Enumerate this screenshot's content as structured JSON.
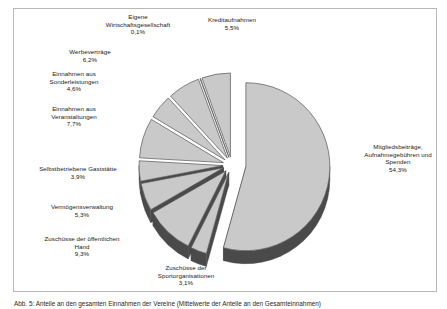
{
  "figure": {
    "frame_color": "#b9b9b9",
    "background": "#ffffff",
    "caption": "Abb. 5: Anteile an den gesamten Einnahmen der Vereine (Mittelwerte der Anteile an den Gesamteinnahmen)"
  },
  "chart_data": {
    "type": "pie",
    "title": "",
    "subtitle": "",
    "xlabel": "",
    "ylabel": "",
    "legend_position": "labels-outside",
    "grid": false,
    "style": "3d-exploded",
    "value_unit": "%",
    "decimal_separator": ",",
    "slice_fill": "#c9c9c9",
    "slice_side": "#4a4a4a",
    "slice_stroke": "#555555",
    "total": 100.0,
    "categories": [
      "Mitgliedsbeiträge, Aufnahmegebühren und Spenden",
      "Zuschüsse der Sportorganisationen",
      "Zuschüsse der öffentlichen Hand",
      "Vermögensverwaltung",
      "Selbstbetriebene Gaststätte",
      "Einnahmen aus Veranstaltungen",
      "Einnahmen aus Sonderleistungen",
      "Werbeverträge",
      "Eigene Wirtschaftsgesellschaft",
      "Kreditaufnahmen"
    ],
    "values": [
      54.3,
      3.1,
      9.3,
      5.3,
      3.9,
      7.7,
      4.6,
      6.2,
      0.1,
      5.5
    ],
    "slices": [
      {
        "label": "Mitgliedsbeiträge,\nAufnahmegebühren und\nSpenden",
        "value": 54.3,
        "value_text": "54,3%",
        "label_x": 352,
        "label_y": 143,
        "label_w": 92
      },
      {
        "label": "Zuschüsse der\nSportorganisationen",
        "value": 3.1,
        "value_text": "3,1%",
        "label_x": 140,
        "label_y": 264,
        "label_w": 92
      },
      {
        "label": "Zuschüsse der öffentlichen\nHand",
        "value": 9.3,
        "value_text": "9,3%",
        "label_x": 26,
        "label_y": 235,
        "label_w": 112
      },
      {
        "label": "Vermögensverwaltung",
        "value": 5.3,
        "value_text": "5,3%",
        "label_x": 26,
        "label_y": 203,
        "label_w": 112
      },
      {
        "label": "Selbstbetriebene Gaststätte",
        "value": 3.9,
        "value_text": "3,9%",
        "label_x": 18,
        "label_y": 165,
        "label_w": 120
      },
      {
        "label": "Einnahmen aus\nVeranstaltungen",
        "value": 7.7,
        "value_text": "7,7%",
        "label_x": 22,
        "label_y": 105,
        "label_w": 104
      },
      {
        "label": "Einnahmen aus\nSonderleistungen",
        "value": 4.6,
        "value_text": "4,6%",
        "label_x": 22,
        "label_y": 70,
        "label_w": 104
      },
      {
        "label": "Werbeverträge",
        "value": 6.2,
        "value_text": "6,2%",
        "label_x": 44,
        "label_y": 48,
        "label_w": 92
      },
      {
        "label": "Eigene\nWirtschaftsgesellschaft",
        "value": 0.1,
        "value_text": "0,1%",
        "label_x": 88,
        "label_y": 13,
        "label_w": 100
      },
      {
        "label": "Kreditaufnahmen",
        "value": 5.5,
        "value_text": "5,5%",
        "label_x": 186,
        "label_y": 16,
        "label_w": 92
      }
    ],
    "geometry": {
      "cx": 232,
      "cy": 165,
      "rx": 84,
      "ry": 84,
      "depth": 13,
      "start_angle_deg": -90,
      "direction": "clockwise",
      "explode_offset": 9,
      "big_slice_explode": 14
    }
  }
}
